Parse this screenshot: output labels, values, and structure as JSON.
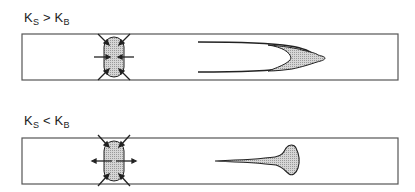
{
  "panels": [
    {
      "id": "top",
      "condition": {
        "k1": "K",
        "k1_sub": "S",
        "op": ">",
        "k2": "K",
        "k2_sub": "B"
      },
      "description": "Fracture front tip: elongated U-shaped wedge with shaded bulbous head"
    },
    {
      "id": "bottom",
      "condition": {
        "k1": "K",
        "k1_sub": "S",
        "op": "<",
        "k2": "K",
        "k2_sub": "B"
      },
      "description": "Thin tapered tail ending in shaded rounded bulb"
    }
  ],
  "colors": {
    "stroke": "#222222",
    "fill": "#c8c8c8",
    "box": "#555555"
  }
}
